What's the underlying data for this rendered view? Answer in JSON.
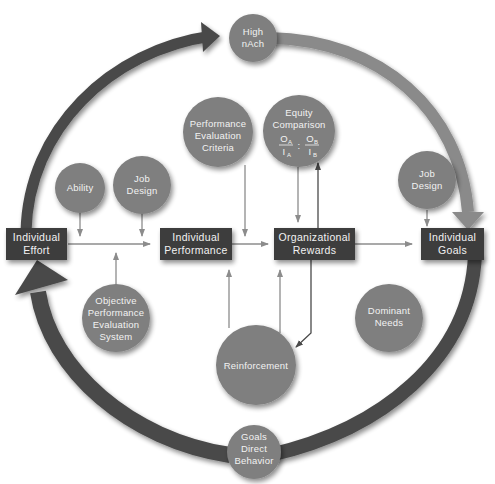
{
  "colors": {
    "background": "#ffffff",
    "box_fill": "#3d3d3d",
    "circle_fill": "#7f7f7f",
    "cycle_arrow_dark": "#4a4a4a",
    "cycle_arrow_light": "#8a8a8a",
    "connector_line": "#8c8c8c",
    "connector_dark": "#4a4a4a",
    "text_on_shape": "#f2f2f2"
  },
  "boxes": {
    "individual_effort": {
      "line1": "Individual",
      "line2": "Effort"
    },
    "individual_performance": {
      "line1": "Individual",
      "line2": "Performance"
    },
    "organizational_rewards": {
      "line1": "Organizational",
      "line2": "Rewards"
    },
    "individual_goals": {
      "line1": "Individual",
      "line2": "Goals"
    }
  },
  "circles": {
    "high_nach": {
      "line1": "High",
      "line2": "nAch"
    },
    "ability": {
      "line1": "Ability"
    },
    "job_design_left": {
      "line1": "Job",
      "line2": "Design"
    },
    "performance_evaluation_criteria": {
      "line1": "Performance",
      "line2": "Evaluation",
      "line3": "Criteria"
    },
    "equity_comparison": {
      "line1": "Equity",
      "line2": "Comparison",
      "ratio_a_num": "O",
      "ratio_a_num_sub": "A",
      "ratio_a_den": "I",
      "ratio_a_den_sub": "A",
      "separator": ":",
      "ratio_b_num": "O",
      "ratio_b_num_sub": "B",
      "ratio_b_den": "I",
      "ratio_b_den_sub": "B"
    },
    "job_design_right": {
      "line1": "Job",
      "line2": "Design"
    },
    "objective_performance_evaluation_system": {
      "line1": "Objective",
      "line2": "Performance",
      "line3": "Evaluation",
      "line4": "System"
    },
    "dominant_needs": {
      "line1": "Dominant",
      "line2": "Needs"
    },
    "reinforcement": {
      "line1": "Reinforcement"
    },
    "goals_direct_behavior": {
      "line1": "Goals",
      "line2": "Direct",
      "line3": "Behavior"
    }
  }
}
